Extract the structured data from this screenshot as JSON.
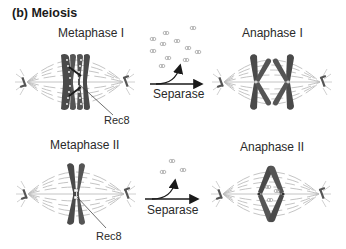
{
  "figure": {
    "title": "(b) Meiosis",
    "panels": {
      "metaphase_1": {
        "label": "Metaphase I",
        "annotation": "Rec8"
      },
      "anaphase_1": {
        "label": "Anaphase I"
      },
      "metaphase_2": {
        "label": "Metaphase II",
        "annotation": "Rec8"
      },
      "anaphase_2": {
        "label": "Anaphase II"
      }
    },
    "arrows": {
      "top": {
        "label": "Separase"
      },
      "bottom": {
        "label": "Separase"
      }
    },
    "colors": {
      "chromosome": "#4a4a4a",
      "spindle": "#b8b8b8",
      "text": "#2a2a2a",
      "cohesin": "#9a9a9a"
    }
  }
}
